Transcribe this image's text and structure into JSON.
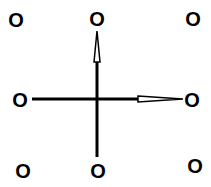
{
  "diagram": {
    "type": "structure-cross",
    "line_color": "#000000",
    "background": "#ffffff",
    "atoms": [
      {
        "id": "top-left",
        "label": "O",
        "x": 16,
        "y": 20
      },
      {
        "id": "top-center",
        "label": "O",
        "x": 97,
        "y": 19
      },
      {
        "id": "top-right",
        "label": "O",
        "x": 193,
        "y": 19
      },
      {
        "id": "middle-left",
        "label": "O",
        "x": 20,
        "y": 100
      },
      {
        "id": "middle-right",
        "label": "O",
        "x": 192,
        "y": 100
      },
      {
        "id": "bottom-left",
        "label": "O",
        "x": 23,
        "y": 171
      },
      {
        "id": "bottom-center",
        "label": "O",
        "x": 98,
        "y": 171
      },
      {
        "id": "bottom-right",
        "label": "O",
        "x": 195,
        "y": 166
      }
    ],
    "bonds": [
      {
        "id": "vertical",
        "from": "top-center",
        "to": "bottom-center",
        "wedge": "up"
      },
      {
        "id": "horizontal",
        "from": "middle-left",
        "to": "middle-right",
        "wedge": "right"
      }
    ]
  }
}
